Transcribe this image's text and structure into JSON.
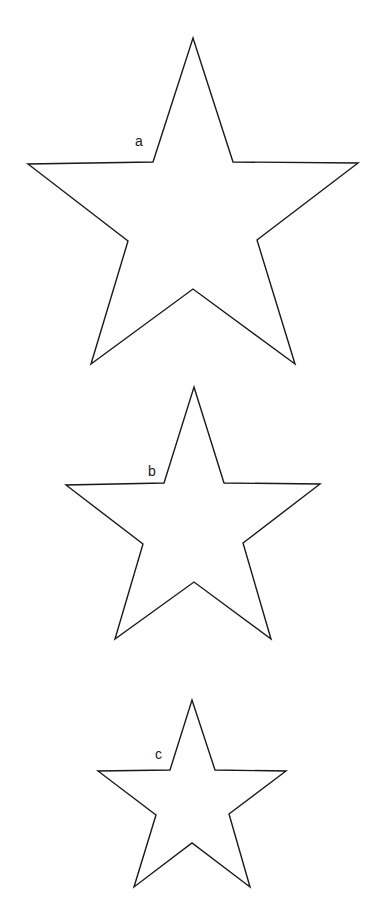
{
  "diagram": {
    "stroke_color": "#1a1a1a",
    "background": "#ffffff",
    "stars": [
      {
        "label": "a",
        "label_pos": [
          135,
          146
        ],
        "points": "193,38 233,162 358,163 257,240 295,364 193,289 91,364 128,241 28,164 153,162"
      },
      {
        "label": "b",
        "label_pos": [
          148,
          476
        ],
        "points": "194,387 224,483 320,484 243,543 271,639 194,582 115,639 143,544 66,485 164,483"
      },
      {
        "label": "c",
        "label_pos": [
          155,
          759
        ],
        "points": "192,700 215,770 286,771 229,814 250,887 192,843 134,887 156,815 98,771 170,770"
      }
    ]
  }
}
